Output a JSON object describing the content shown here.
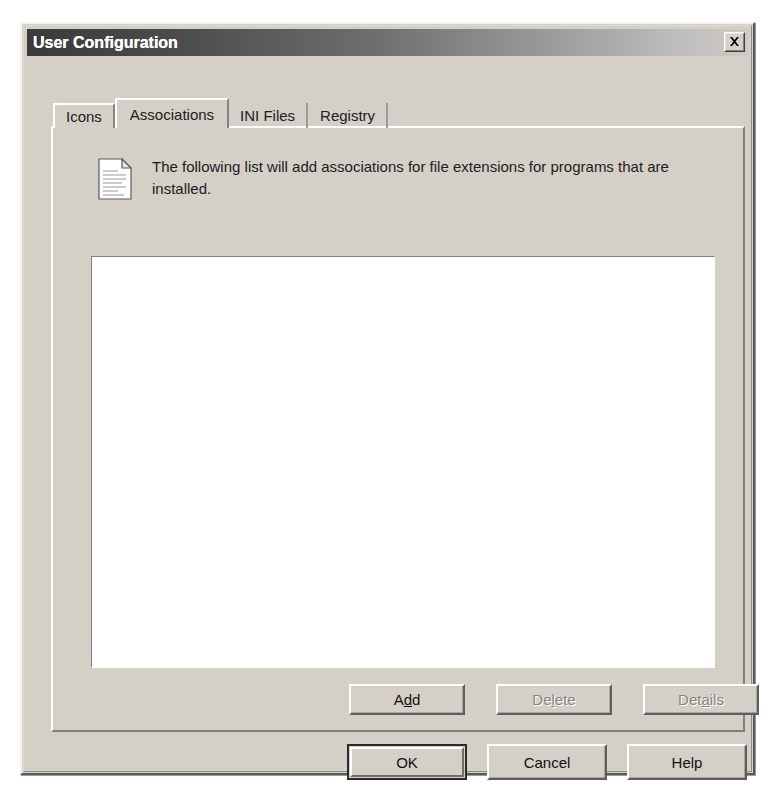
{
  "window": {
    "title": "User Configuration",
    "close_icon": "close-x-icon",
    "close_tooltip": "Close"
  },
  "tabs": [
    {
      "label": "Icons",
      "selected": false
    },
    {
      "label": "Associations",
      "selected": true
    },
    {
      "label": "INI Files",
      "selected": false
    },
    {
      "label": "Registry",
      "selected": false
    }
  ],
  "tab_page": {
    "icon": "document-page-icon",
    "description": "The following list will add associations for file extensions for programs that are installed.",
    "listbox": {
      "items": [],
      "empty": true
    },
    "buttons": [
      {
        "label": "Add",
        "accel": "d",
        "enabled": true,
        "name": "add-button"
      },
      {
        "label": "Delete",
        "accel": "l",
        "enabled": false,
        "name": "delete-button"
      },
      {
        "label": "Details",
        "accel": "a",
        "enabled": false,
        "name": "details-button"
      }
    ]
  },
  "dialog_buttons": [
    {
      "label": "OK",
      "default": true,
      "name": "ok-button"
    },
    {
      "label": "Cancel",
      "default": false,
      "name": "cancel-button"
    },
    {
      "label": "Help",
      "default": false,
      "name": "help-button"
    }
  ],
  "colors": {
    "face": "#d4d0c8",
    "title_start": "#3a3a3a",
    "title_end": "#cfcbc4",
    "text": "#101010",
    "disabled_text": "#878480",
    "listbox_bg": "#ffffff"
  }
}
